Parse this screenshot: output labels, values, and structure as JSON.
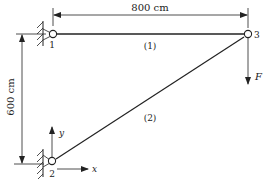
{
  "diagram": {
    "type": "two-bar truss",
    "nodes": [
      {
        "id": "1",
        "label": "1"
      },
      {
        "id": "2",
        "label": "2"
      },
      {
        "id": "3",
        "label": "3"
      }
    ],
    "members": [
      {
        "id": "1",
        "label": "(1)",
        "from": "1",
        "to": "3"
      },
      {
        "id": "2",
        "label": "(2)",
        "from": "2",
        "to": "3"
      }
    ],
    "dimensions": {
      "horizontal": "800 cm",
      "vertical": "600 cm"
    },
    "load": {
      "label": "F",
      "node": "3",
      "direction": "down"
    },
    "axes": {
      "x_label": "x",
      "y_label": "y",
      "origin_node": "2"
    },
    "colors": {
      "line": "#222222",
      "background": "#ffffff"
    }
  }
}
